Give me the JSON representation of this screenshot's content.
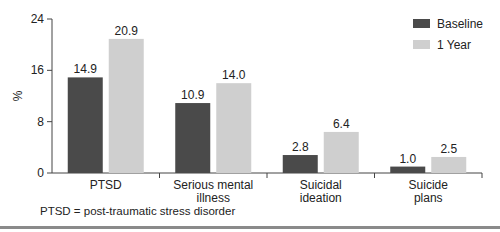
{
  "chart_data": {
    "type": "bar",
    "title": "",
    "xlabel": "",
    "ylabel": "%",
    "ylim": [
      0,
      24
    ],
    "yticks": [
      0,
      8,
      16,
      24
    ],
    "grid": false,
    "legend_position": "top-right",
    "categories": [
      "PTSD",
      "Serious mental illness",
      "Suicidal ideation",
      "Suicide plans"
    ],
    "category_lines": [
      [
        "PTSD"
      ],
      [
        "Serious mental",
        "illness"
      ],
      [
        "Suicidal",
        "ideation"
      ],
      [
        "Suicide",
        "plans"
      ]
    ],
    "series": [
      {
        "name": "Baseline",
        "color": "#4a4a4a",
        "values": [
          14.9,
          10.9,
          2.8,
          1.0
        ]
      },
      {
        "name": "1 Year",
        "color": "#cfcfcf",
        "values": [
          20.9,
          14.0,
          6.4,
          2.5
        ]
      }
    ],
    "value_labels": [
      [
        "14.9",
        "10.9",
        "2.8",
        "1.0"
      ],
      [
        "20.9",
        "14.0",
        "6.4",
        "2.5"
      ]
    ]
  },
  "footnote": "PTSD = post-traumatic stress disorder"
}
